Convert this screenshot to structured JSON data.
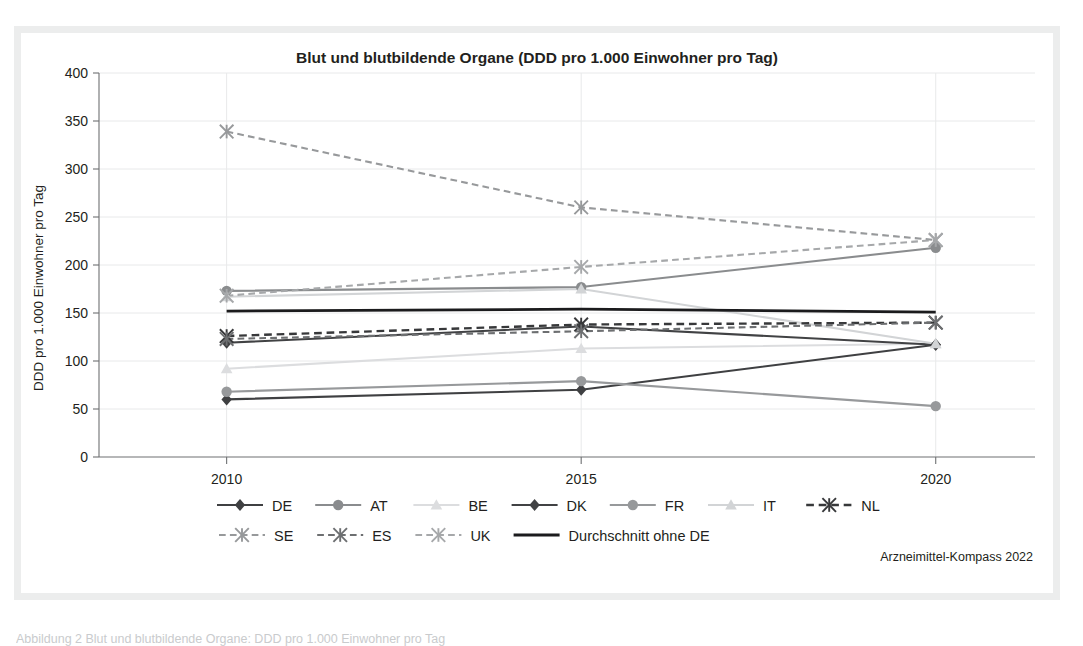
{
  "figure": {
    "credit": "Arzneimittel-Kompass 2022",
    "bottom_caption": "Abbildung 2 Blut und blutbildende Organe: DDD pro 1.000 Einwohner pro Tag"
  },
  "chart_data": {
    "type": "line",
    "title": "Blut und blutbildende Organe (DDD pro 1.000 Einwohner pro Tag)",
    "xlabel": "",
    "ylabel": "DDD pro 1.000 Einwohner pro Tag",
    "categories": [
      "2010",
      "2015",
      "2020"
    ],
    "x": [
      2010,
      2015,
      2020
    ],
    "xlim": [
      2008.2,
      2021.4
    ],
    "ylim": [
      0,
      400
    ],
    "ytick_step": 50,
    "yticks": [
      0,
      50,
      100,
      150,
      200,
      250,
      300,
      350,
      400
    ],
    "grid": true,
    "legend_position": "bottom",
    "series": [
      {
        "name": "DE",
        "values": [
          60,
          70,
          117
        ],
        "color": "#3f4042",
        "dash": "solid",
        "marker": "diamond",
        "width": 2.1
      },
      {
        "name": "AT",
        "values": [
          173,
          177,
          218
        ],
        "color": "#8a8c8e",
        "dash": "solid",
        "marker": "circle",
        "width": 2.1
      },
      {
        "name": "BE",
        "values": [
          92,
          113,
          118
        ],
        "color": "#dcdddf",
        "dash": "solid",
        "marker": "triangle",
        "width": 2.1
      },
      {
        "name": "DK",
        "values": [
          119,
          136,
          117
        ],
        "color": "#414244",
        "dash": "solid",
        "marker": "diamond",
        "width": 2.1
      },
      {
        "name": "FR",
        "values": [
          68,
          79,
          53
        ],
        "color": "#97999b",
        "dash": "solid",
        "marker": "circle",
        "width": 2.1
      },
      {
        "name": "IT",
        "values": [
          167,
          175,
          118
        ],
        "color": "#d2d4d6",
        "dash": "solid",
        "marker": "triangle",
        "width": 2.1
      },
      {
        "name": "NL",
        "values": [
          126,
          138,
          140
        ],
        "color": "#37383a",
        "dash": "dashed",
        "marker": "cross",
        "width": 2.4
      },
      {
        "name": "SE",
        "values": [
          339,
          260,
          226
        ],
        "color": "#97999b",
        "dash": "dashed",
        "marker": "cross",
        "width": 2.1
      },
      {
        "name": "ES",
        "values": [
          123,
          131,
          140
        ],
        "color": "#6d6f71",
        "dash": "dashed",
        "marker": "cross",
        "width": 2.1
      },
      {
        "name": "UK",
        "values": [
          168,
          198,
          226
        ],
        "color": "#a6a8aa",
        "dash": "dashed",
        "marker": "cross",
        "width": 2.1
      },
      {
        "name": "Durchschnitt ohne DE",
        "values": [
          152,
          154,
          151
        ],
        "color": "#1b1b1d",
        "dash": "solid",
        "marker": "none",
        "width": 2.8
      }
    ],
    "legend_rows": [
      [
        "DE",
        "AT",
        "BE",
        "DK",
        "FR",
        "IT",
        "NL"
      ],
      [
        "SE",
        "ES",
        "UK",
        "Durchschnitt ohne DE"
      ]
    ]
  }
}
